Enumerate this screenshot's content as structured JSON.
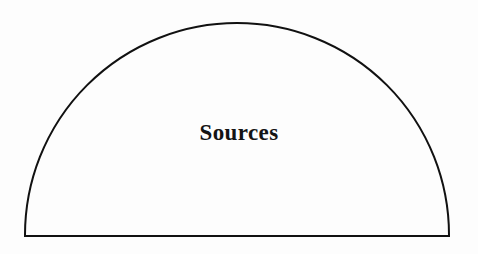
{
  "figure": {
    "background_color": "#fdfdfd",
    "stroke_color": "#111111",
    "stroke_width": 2,
    "shape": {
      "name": "semicircular-dome",
      "icon_name": "dome-outline-icon",
      "baseline_y": 236,
      "left_x": 25,
      "right_x": 449,
      "apex_y": 23,
      "radius": 212,
      "center_x": 237
    },
    "label": {
      "text": "Sources",
      "color": "#141414",
      "font_size": 23,
      "font_weight": "bold",
      "center_x": 238,
      "center_y": 133
    }
  }
}
